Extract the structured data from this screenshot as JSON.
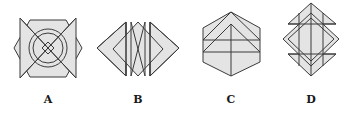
{
  "figure_set": {
    "description": "Four geometric line figures labelled A to D",
    "colors": {
      "fill": "#e4e4e4",
      "stroke": "#3a3a3a",
      "background": "#ffffff",
      "label": "#1a1a1a"
    },
    "options": [
      {
        "label": "A",
        "shape": "octagon-with-bowtie-triangles-concentric-circles-and-x"
      },
      {
        "label": "B",
        "shape": "opposing-triangles-with-inner-diamond-and-crossed-bars"
      },
      {
        "label": "C",
        "shape": "hexagon-with-nested-triangles-and-two-horizontal-lines"
      },
      {
        "label": "D",
        "shape": "overlapping-diamonds-with-vertical-and-horizontal-bars"
      }
    ]
  }
}
